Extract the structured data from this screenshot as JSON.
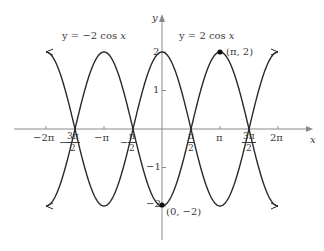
{
  "chart_data": {
    "type": "line",
    "title": "",
    "xlabel": "x",
    "ylabel": "y",
    "xlim": [
      -6.2832,
      6.2832
    ],
    "ylim": [
      -2.6,
      2.6
    ],
    "grid": false,
    "legend": "inline labels above curves",
    "x_ticks": [
      {
        "value": -6.2832,
        "label": "−2π"
      },
      {
        "value": -4.7124,
        "label": "−3π/2"
      },
      {
        "value": -3.1416,
        "label": "−π"
      },
      {
        "value": -1.5708,
        "label": "−π/2"
      },
      {
        "value": 1.5708,
        "label": "π/2"
      },
      {
        "value": 3.1416,
        "label": "π"
      },
      {
        "value": 4.7124,
        "label": "3π/2"
      },
      {
        "value": 6.2832,
        "label": "2π"
      }
    ],
    "y_ticks": [
      {
        "value": 2,
        "label": "2"
      },
      {
        "value": 1,
        "label": "1"
      },
      {
        "value": -1,
        "label": "−1"
      },
      {
        "value": -2,
        "label": "−2"
      }
    ],
    "series": [
      {
        "name": "y = 2 cos x",
        "expression": "2*cos(x)",
        "x": [
          -6.2832,
          -4.7124,
          -3.1416,
          -1.5708,
          0,
          1.5708,
          3.1416,
          4.7124,
          6.2832
        ],
        "values": [
          2,
          0,
          -2,
          0,
          2,
          0,
          -2,
          0,
          2
        ]
      },
      {
        "name": "y = −2 cos x",
        "expression": "-2*cos(x)",
        "x": [
          -6.2832,
          -4.7124,
          -3.1416,
          -1.5708,
          0,
          1.5708,
          3.1416,
          4.7124,
          6.2832
        ],
        "values": [
          -2,
          0,
          2,
          0,
          -2,
          0,
          2,
          0,
          -2
        ]
      }
    ],
    "annotations": [
      {
        "point": [
          3.1416,
          2
        ],
        "label": "(π, 2)",
        "marker": "filled-dot"
      },
      {
        "point": [
          0,
          -2
        ],
        "label": "(0, −2)",
        "marker": "filled-dot"
      }
    ],
    "colors": {
      "curve": "#2a2a2a",
      "axis": "#8a8a8a",
      "text": "#3a3a3a"
    }
  },
  "labels": {
    "series_neg": {
      "prefix": "y = −2 cos ",
      "var": "x"
    },
    "series_pos": {
      "prefix": "y = 2 cos ",
      "var": "x"
    },
    "x_axis": "x",
    "y_axis": "y",
    "pt_pi_2": "(π, 2)",
    "pt_0_m2": "(0, −2)",
    "ticks": {
      "neg2pi": "−2π",
      "negpi": "−π",
      "pi": "π",
      "twopi": "2π",
      "minus": "−",
      "three_pi": "3π",
      "pi_only": "π",
      "two": "2",
      "y2": "2",
      "y1": "1",
      "ym1": "−1",
      "ym2": "−2"
    }
  }
}
